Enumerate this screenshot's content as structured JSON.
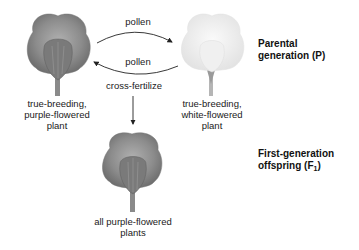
{
  "parents": {
    "left": {
      "label_line1": "true-breeding,",
      "label_line2": "purple-flowered",
      "label_line3": "plant",
      "flower_color": "#8a8a8a"
    },
    "right": {
      "label_line1": "true-breeding,",
      "label_line2": "white-flowered",
      "label_line3": "plant",
      "flower_color": "#ececec"
    }
  },
  "arrows": {
    "top_label": "pollen",
    "bottom_label": "pollen",
    "down_label": "cross-fertilize"
  },
  "offspring": {
    "label_line1": "all purple-flowered",
    "label_line2": "plants",
    "flower_color": "#8a8a8a"
  },
  "generations": {
    "parental_line1": "Parental",
    "parental_line2": "generation (P)",
    "f1_line1": "First-generation",
    "f1_line2": "offspring (F",
    "f1_sub": "1",
    "f1_close": ")"
  }
}
